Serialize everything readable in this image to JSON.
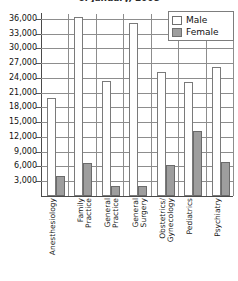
{
  "chart_data": {
    "type": "bar",
    "title": "of January, 2008",
    "xlabel": "",
    "ylabel": "",
    "ylim": [
      0,
      37000
    ],
    "grid": true,
    "legend_position": "top-right",
    "categories": [
      "Anesthesiology",
      "Family\nPractice",
      "General\nPractice",
      "General\nSurgery",
      "Obstetrics/\nGynecology",
      "Pediatrics",
      "Psychiatry"
    ],
    "yticks": [
      "3,000",
      "6,000",
      "9,000",
      "12,000",
      "15,000",
      "18,000",
      "21,000",
      "24,000",
      "27,000",
      "30,000",
      "33,000",
      "36,000"
    ],
    "series": [
      {
        "name": "Male",
        "color": "#ffffff",
        "values": [
          19900,
          36400,
          23300,
          35200,
          25200,
          23200,
          26200
        ]
      },
      {
        "name": "Female",
        "color": "#9e9e9e",
        "values": [
          4100,
          6800,
          2100,
          2100,
          6400,
          13200,
          7000
        ]
      }
    ]
  },
  "legend": {
    "items": [
      {
        "label": "Male"
      },
      {
        "label": "Female"
      }
    ]
  }
}
